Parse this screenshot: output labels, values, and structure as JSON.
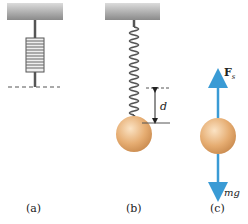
{
  "panels": [
    {
      "id": "a",
      "label": "(a)"
    },
    {
      "id": "b",
      "label": "(b)",
      "displacement_label": "d"
    },
    {
      "id": "c",
      "label": "(c)",
      "force_up_label": "F",
      "force_up_subscript": "s",
      "force_down_label": "mg"
    }
  ],
  "colors": {
    "ceiling": "#9a9a9a",
    "spring": "#555555",
    "ball": "#e0a56a",
    "arrow": "#3a9bd5"
  }
}
